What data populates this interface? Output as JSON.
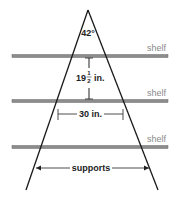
{
  "diagram": {
    "type": "shelf-frame",
    "apex_angle_label": "42°",
    "shelves": [
      {
        "label": "shelf",
        "y": 56
      },
      {
        "label": "shelf",
        "y": 101
      },
      {
        "label": "shelf",
        "y": 147
      }
    ],
    "shelf_spacing": {
      "whole": "19",
      "num": "1",
      "den": "2",
      "unit": "in."
    },
    "width_label": "30 in.",
    "supports_label": "supports",
    "colors": {
      "shelf": "#8c8c8c",
      "shelf_edge": "#6a6a6a",
      "legs": "#1a1a1a",
      "shelf_label": "#8a8a8a",
      "text": "#222222"
    }
  }
}
